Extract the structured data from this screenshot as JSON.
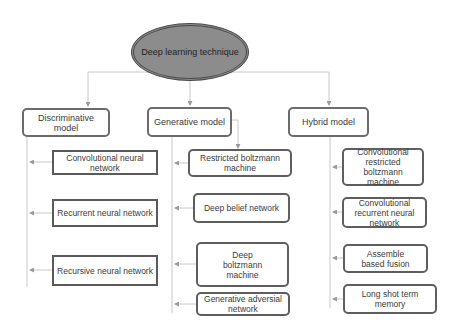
{
  "root": {
    "label": "Deep learning technique",
    "fill": "#8c8c8c"
  },
  "categories": [
    {
      "label": "Discriminative model",
      "children": [
        "Convolutional neural network",
        "Recurrent neural network",
        "Recursive neural network"
      ]
    },
    {
      "label": "Generative model",
      "children": [
        "Restricted boltzmann machine",
        "Deep belief network",
        "Deep boltzmann machine",
        "Generative adversial network"
      ]
    },
    {
      "label": "Hybrid model",
      "children": [
        "Convolutional restricted boltzmann machine",
        "Convolutional recurrent neural network",
        "Assemble based fusion",
        "Long shot term memory"
      ]
    }
  ],
  "colors": {
    "line": "#c8c8c8",
    "border": "#5e5e5e",
    "arrow": "#9a9a9a"
  }
}
